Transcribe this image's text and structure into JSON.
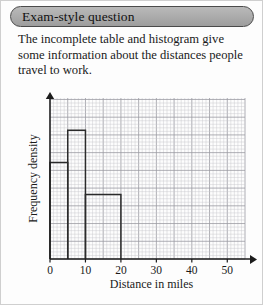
{
  "header": {
    "title": "Exam-style question"
  },
  "question": {
    "text": "The incomplete table and histogram give some information about the distances people travel to work."
  },
  "chart_data": {
    "type": "bar",
    "title": "",
    "xlabel": "Distance in miles",
    "ylabel": "Frequency density",
    "xlim": [
      0,
      55
    ],
    "ylim": [
      0,
      5
    ],
    "grid": true,
    "grid_minor_step": 1,
    "grid_major_step": 5,
    "legend": "none",
    "x_ticks": [
      0,
      10,
      20,
      30,
      40,
      50
    ],
    "x_tick_labels": [
      "0",
      "10",
      "20",
      "30",
      "40",
      "50"
    ],
    "y_ticks": [],
    "y_tick_labels": [],
    "bars": [
      {
        "label": "0-5",
        "x_start": 0,
        "x_end": 5,
        "frequency_density": 3
      },
      {
        "label": "5-10",
        "x_start": 5,
        "x_end": 10,
        "frequency_density": 4
      },
      {
        "label": "10-20",
        "x_start": 10,
        "x_end": 20,
        "frequency_density": 2
      }
    ],
    "axis_arrows": {
      "x": true,
      "y": true
    }
  },
  "colors": {
    "header_fill": "#adadad",
    "header_border": "#4a4a4a",
    "page_border": "#cfcfcf",
    "grid_minor": "#c8c8cc",
    "grid_major": "#9a9aa2",
    "axis": "#1c1c1c",
    "bar_stroke": "#2b2b2b",
    "text": "#1a1a1a"
  }
}
